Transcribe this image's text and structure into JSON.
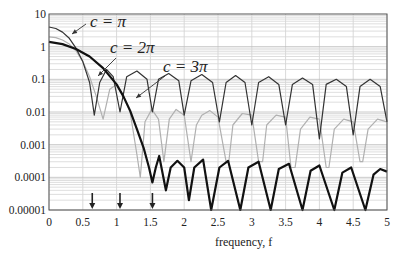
{
  "chart_data": {
    "type": "line",
    "title": "",
    "xlabel": "frequency, f",
    "ylabel": "",
    "xscale": "linear",
    "yscale": "log",
    "xlim": [
      0,
      5
    ],
    "ylim": [
      1e-05,
      10
    ],
    "grid": true,
    "legend_position": "annotations",
    "x_ticks": [
      0,
      0.5,
      1,
      1.5,
      2,
      2.5,
      3,
      3.5,
      4,
      4.5,
      5
    ],
    "x_tick_labels": [
      "0",
      "0.5",
      "1",
      "1.5",
      "2",
      "2.5",
      "3",
      "3.5",
      "4",
      "4.5",
      "5"
    ],
    "y_ticks": [
      10,
      1,
      0.1,
      0.01,
      0.001,
      0.0001,
      1e-05
    ],
    "y_tick_labels": [
      "10",
      "1",
      "0.1",
      "0.01",
      "0.001",
      "0.0001",
      "0.00001"
    ],
    "series": [
      {
        "name": "c = π",
        "color": "#333333",
        "line_width": 1.2,
        "x": [
          0,
          0.1,
          0.2,
          0.3,
          0.4,
          0.5,
          0.6,
          0.67,
          0.75,
          0.85,
          0.95,
          1.05,
          1.15,
          1.3,
          1.45,
          1.53,
          1.62,
          1.77,
          1.92,
          2.0,
          2.1,
          2.26,
          2.42,
          2.52,
          2.62,
          2.76,
          2.9,
          3.0,
          3.1,
          3.25,
          3.4,
          3.5,
          3.6,
          3.75,
          3.9,
          4.0,
          4.1,
          4.25,
          4.4,
          4.5,
          4.6,
          4.75,
          4.9,
          5.0
        ],
        "y": [
          4.0,
          3.6,
          2.8,
          1.8,
          0.9,
          0.35,
          0.08,
          0.008,
          0.08,
          0.2,
          0.12,
          0.01,
          0.12,
          0.18,
          0.1,
          0.01,
          0.1,
          0.15,
          0.09,
          0.008,
          0.09,
          0.14,
          0.08,
          0.005,
          0.08,
          0.13,
          0.08,
          0.004,
          0.08,
          0.12,
          0.07,
          0.004,
          0.07,
          0.11,
          0.07,
          0.0015,
          0.07,
          0.1,
          0.06,
          0.002,
          0.06,
          0.1,
          0.06,
          0.005
        ]
      },
      {
        "name": "c = 2π",
        "color": "#b0b0b0",
        "line_width": 1.2,
        "x": [
          0,
          0.1,
          0.2,
          0.3,
          0.4,
          0.5,
          0.6,
          0.7,
          0.8,
          0.9,
          1.0,
          1.1,
          1.2,
          1.3,
          1.35,
          1.42,
          1.52,
          1.62,
          1.7,
          1.78,
          1.88,
          2.0,
          2.1,
          2.18,
          2.26,
          2.38,
          2.5,
          2.62,
          2.66,
          2.72,
          2.86,
          3.0,
          3.1,
          3.16,
          3.22,
          3.36,
          3.5,
          3.58,
          3.64,
          3.72,
          3.86,
          4.0,
          4.1,
          4.14,
          4.22,
          4.36,
          4.5,
          4.6,
          4.64,
          4.72,
          4.86,
          5.0
        ],
        "y": [
          2.0,
          1.9,
          1.6,
          1.2,
          0.75,
          0.35,
          0.12,
          0.03,
          0.006,
          0.05,
          0.07,
          0.03,
          0.01,
          0.0005,
          0.0001,
          0.005,
          0.012,
          0.006,
          0.0003,
          0.006,
          0.012,
          0.008,
          0.0003,
          0.004,
          0.008,
          0.011,
          0.007,
          0.0003,
          0.0003,
          0.004,
          0.009,
          0.008,
          0.0003,
          0.0003,
          0.004,
          0.008,
          0.007,
          0.0002,
          0.0002,
          0.003,
          0.007,
          0.006,
          0.0002,
          0.0002,
          0.003,
          0.006,
          0.005,
          0.0003,
          0.0003,
          0.003,
          0.006,
          0.005
        ]
      },
      {
        "name": "c = 3π",
        "color": "#111111",
        "line_width": 2.2,
        "x": [
          0,
          0.2,
          0.4,
          0.6,
          0.8,
          1.0,
          1.1,
          1.2,
          1.3,
          1.4,
          1.48,
          1.53,
          1.58,
          1.63,
          1.73,
          1.8,
          1.9,
          2.0,
          2.07,
          2.15,
          2.28,
          2.4,
          2.52,
          2.65,
          2.83,
          2.95,
          3.1,
          3.28,
          3.4,
          3.55,
          3.75,
          3.87,
          4.0,
          4.22,
          4.34,
          4.47,
          4.68,
          4.8,
          4.9,
          5.0
        ],
        "y": [
          1.4,
          1.2,
          0.85,
          0.5,
          0.22,
          0.07,
          0.03,
          0.011,
          0.003,
          0.0008,
          0.0002,
          7e-05,
          0.0002,
          0.00045,
          4e-05,
          0.0002,
          0.00032,
          0.0002,
          2e-05,
          0.0002,
          0.00035,
          1e-05,
          0.0002,
          0.00032,
          1e-05,
          0.0002,
          0.0003,
          1e-05,
          0.00018,
          0.00026,
          1e-05,
          0.00016,
          0.00023,
          1e-05,
          0.00014,
          0.0002,
          1e-05,
          0.00012,
          0.00018,
          0.00015
        ]
      }
    ],
    "annotations": [
      {
        "text": "c = π",
        "target_series": "c = π",
        "x": 1.2,
        "y": 4.5
      },
      {
        "text": "c = 2π",
        "target_series": "c = 2π",
        "x": 1.6,
        "y": 1.1
      },
      {
        "text": "c = 3π",
        "target_series": "c = 3π",
        "x": 2.1,
        "y": 0.3
      }
    ],
    "arrows_on_x_axis": [
      0.64,
      1.05,
      1.53
    ]
  }
}
